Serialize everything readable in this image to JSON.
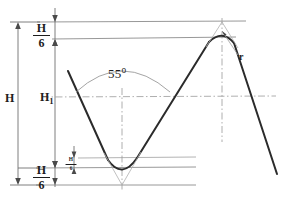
{
  "drawing": {
    "title": "Whitworth thread profile",
    "colors": {
      "profile": "#2b2b2b",
      "reference": "#8c8c8c",
      "dimension": "#707070",
      "construction": "#b0b0b0",
      "background": "#ffffff",
      "text": "#1d1d1d"
    },
    "labels": {
      "overall_height": "H",
      "thread_height": "H",
      "thread_height_subscript": "1",
      "angle": "55",
      "angle_degree_symbol": "o",
      "radius": "r",
      "crest_truncation": {
        "numerator": "H",
        "denominator": "6"
      },
      "root_truncation": {
        "numerator": "H",
        "denominator": "6"
      },
      "root_detail": {
        "numerator": "H",
        "denominator": "6"
      }
    }
  }
}
